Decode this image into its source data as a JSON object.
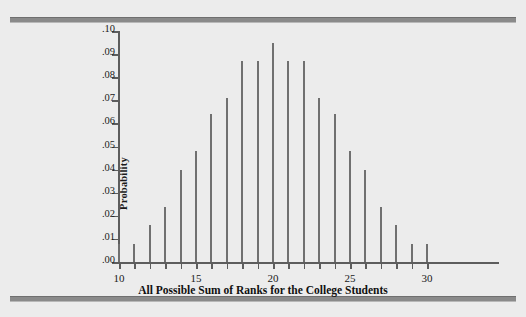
{
  "figure": {
    "y_axis_title": "Probability",
    "x_axis_title": "All Possible Sum of Ranks for the College Students"
  },
  "chart_data": {
    "type": "bar",
    "title": "",
    "xlabel": "All Possible Sum of Ranks for the College Students",
    "ylabel": "Probability",
    "xlim": [
      10,
      30
    ],
    "ylim": [
      0.0,
      0.1
    ],
    "grid": false,
    "legend": null,
    "x_tick_values": [
      10,
      11,
      12,
      13,
      14,
      15,
      16,
      17,
      18,
      19,
      20,
      21,
      22,
      23,
      24,
      25,
      26,
      27,
      28,
      29,
      30
    ],
    "x_tick_labels": [
      "10",
      "",
      "",
      "",
      "",
      "15",
      "",
      "",
      "",
      "",
      "20",
      "",
      "",
      "",
      "",
      "25",
      "",
      "",
      "",
      "",
      "30"
    ],
    "y_tick_values": [
      0.0,
      0.01,
      0.02,
      0.03,
      0.04,
      0.05,
      0.06,
      0.07,
      0.08,
      0.09,
      0.1
    ],
    "y_tick_labels": [
      ".00",
      ".01",
      ".02",
      ".03",
      ".04",
      ".05",
      ".06",
      ".07",
      ".08",
      ".09",
      ".10"
    ],
    "categories": [
      10,
      11,
      12,
      13,
      14,
      15,
      16,
      17,
      18,
      19,
      20,
      21,
      22,
      23,
      24,
      25,
      26,
      27,
      28,
      29,
      30
    ],
    "values": [
      0.008,
      0.008,
      0.016,
      0.024,
      0.04,
      0.048,
      0.064,
      0.071,
      0.087,
      0.087,
      0.095,
      0.087,
      0.087,
      0.071,
      0.064,
      0.048,
      0.04,
      0.024,
      0.016,
      0.008,
      0.008
    ],
    "bar_color": "#707070"
  },
  "style": {
    "background": "#ececec",
    "axis_color": "#5d5d5d",
    "rule_color": "#8a8a8a"
  }
}
